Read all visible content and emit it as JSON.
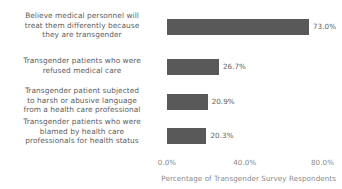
{
  "chart_data": {
    "type": "bar",
    "orientation": "horizontal",
    "title": "",
    "subtitle": "",
    "xlabel": "Percentage of Transgender Survey Respondents",
    "ylabel": "",
    "xlim": [
      0,
      90
    ],
    "xticks": [
      0,
      40,
      80
    ],
    "xtick_labels": [
      "0.0%",
      "40.0%",
      "80.0%"
    ],
    "grid": false,
    "legend": false,
    "bar_color": "#595959",
    "text_color": "#5e5e5e",
    "axis_text_color": "#8a8a8a",
    "background": "#ffffff",
    "categories": [
      "Believe medical personnel will treat them differently because they are transgender",
      "Transgender patients who were refused medical care",
      "Transgender patient subjected to harsh or abusive language from a health care professional",
      "Transgender patients who were blamed by health care professionals for health status"
    ],
    "values": [
      73.0,
      26.7,
      20.9,
      20.3
    ],
    "data_labels": [
      "73.0%",
      "26.7%",
      "20.9%",
      "20.3%"
    ],
    "bars": [
      {
        "category_lines": [
          "Believe medical personnel will",
          "treat them differently because",
          "they are transgender"
        ],
        "value": 73.0,
        "label": "73.0%"
      },
      {
        "category_lines": [
          "Transgender patients who were",
          "refused medical care"
        ],
        "value": 26.7,
        "label": "26.7%"
      },
      {
        "category_lines": [
          "Transgender patient subjected",
          "to harsh or abusive language",
          "from a health care professional"
        ],
        "value": 20.9,
        "label": "20.9%"
      },
      {
        "category_lines": [
          "Transgender patients who were",
          "blamed by health care",
          "professionals for health status"
        ],
        "value": 20.3,
        "label": "20.3%"
      }
    ]
  }
}
